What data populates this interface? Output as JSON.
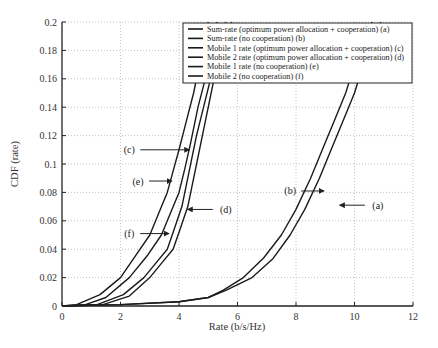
{
  "chart_data": {
    "type": "line",
    "title": "",
    "xlabel": "Rate (b/s/Hz)",
    "ylabel": "CDF (rate)",
    "xlim": [
      0,
      12
    ],
    "ylim": [
      0,
      0.2
    ],
    "x_ticks": [
      0,
      2,
      4,
      6,
      8,
      10,
      12
    ],
    "x_tick_labels": [
      "0",
      "2",
      "4",
      "6",
      "8",
      "10",
      "12"
    ],
    "y_ticks": [
      0,
      0.02,
      0.04,
      0.06,
      0.08,
      0.1,
      0.12,
      0.14,
      0.16,
      0.18,
      0.2
    ],
    "y_tick_labels": [
      "0",
      "0.02",
      "0.04",
      "0.06",
      "0.08",
      "0.1",
      "0.12",
      "0.14",
      "0.16",
      "0.18",
      "0.2"
    ],
    "grid": true,
    "legend_position": "upper right",
    "series": [
      {
        "id": "a",
        "name": "Sum-rate (optimum power allocation + cooperation) (a)",
        "x": [
          0,
          2,
          4,
          5,
          5.6,
          6.5,
          7.2,
          7.8,
          8.3,
          8.8,
          9.2,
          9.6,
          10.0,
          10.3,
          10.6,
          10.9
        ],
        "y": [
          0,
          0.001,
          0.003,
          0.006,
          0.011,
          0.02,
          0.033,
          0.05,
          0.068,
          0.09,
          0.11,
          0.13,
          0.15,
          0.17,
          0.185,
          0.2
        ]
      },
      {
        "id": "b",
        "name": "Sum-rate (no cooperation) (b)",
        "x": [
          0,
          2,
          4,
          5,
          5.5,
          6.2,
          6.9,
          7.5,
          8.0,
          8.5,
          8.9,
          9.3,
          9.7,
          10.0,
          10.3,
          10.6
        ],
        "y": [
          0,
          0.001,
          0.003,
          0.006,
          0.011,
          0.02,
          0.034,
          0.05,
          0.068,
          0.09,
          0.11,
          0.13,
          0.15,
          0.17,
          0.185,
          0.2
        ]
      },
      {
        "id": "c",
        "name": "Mobile 1 rate (optimum power allocation + cooperation) (c)",
        "x": [
          0,
          0.8,
          1.5,
          2.3,
          2.9,
          3.4,
          3.7,
          4.0,
          4.2,
          4.4,
          4.65,
          4.9,
          5.1,
          5.3
        ],
        "y": [
          0,
          0.001,
          0.006,
          0.02,
          0.035,
          0.05,
          0.065,
          0.08,
          0.097,
          0.115,
          0.14,
          0.16,
          0.18,
          0.2
        ]
      },
      {
        "id": "d",
        "name": "Mobile 2 rate (optimum power allocation + cooperation) (d)",
        "x": [
          0,
          1.4,
          2.3,
          3.0,
          3.4,
          3.8,
          4.05,
          4.3,
          4.55,
          4.8,
          5.05,
          5.3,
          5.55,
          5.8
        ],
        "y": [
          0,
          0.001,
          0.007,
          0.02,
          0.03,
          0.04,
          0.055,
          0.07,
          0.095,
          0.12,
          0.145,
          0.17,
          0.185,
          0.2
        ]
      },
      {
        "id": "e",
        "name": "Mobile 1 rate (no cooperation) (e)",
        "x": [
          0,
          0.5,
          1.3,
          2.0,
          2.5,
          3.0,
          3.3,
          3.6,
          3.8,
          4.0,
          4.25,
          4.5,
          4.75,
          5.0
        ],
        "y": [
          0,
          0.001,
          0.008,
          0.02,
          0.035,
          0.05,
          0.065,
          0.08,
          0.095,
          0.11,
          0.13,
          0.15,
          0.175,
          0.2
        ]
      },
      {
        "id": "f",
        "name": "Mobile 2 (no cooperation) (f)",
        "x": [
          0,
          1.2,
          2.1,
          2.8,
          3.2,
          3.6,
          3.85,
          4.1,
          4.35,
          4.6,
          4.9,
          5.2,
          5.4,
          5.6
        ],
        "y": [
          0,
          0.001,
          0.008,
          0.02,
          0.03,
          0.04,
          0.055,
          0.07,
          0.095,
          0.12,
          0.145,
          0.17,
          0.185,
          0.2
        ]
      }
    ],
    "annotations": [
      {
        "label": "(a)",
        "text_x": 10.8,
        "text_y": 0.071,
        "arrow_to_x": 9.5,
        "arrow_to_y": 0.071
      },
      {
        "label": "(b)",
        "text_x": 7.8,
        "text_y": 0.081,
        "arrow_to_x": 8.95,
        "arrow_to_y": 0.081
      },
      {
        "label": "(c)",
        "text_x": 2.3,
        "text_y": 0.11,
        "arrow_to_x": 4.35,
        "arrow_to_y": 0.11
      },
      {
        "label": "(e)",
        "text_x": 2.6,
        "text_y": 0.088,
        "arrow_to_x": 3.75,
        "arrow_to_y": 0.088
      },
      {
        "label": "(d)",
        "text_x": 5.6,
        "text_y": 0.068,
        "arrow_to_x": 4.3,
        "arrow_to_y": 0.068
      },
      {
        "label": "(f)",
        "text_x": 2.3,
        "text_y": 0.051,
        "arrow_to_x": 3.65,
        "arrow_to_y": 0.051
      }
    ]
  }
}
